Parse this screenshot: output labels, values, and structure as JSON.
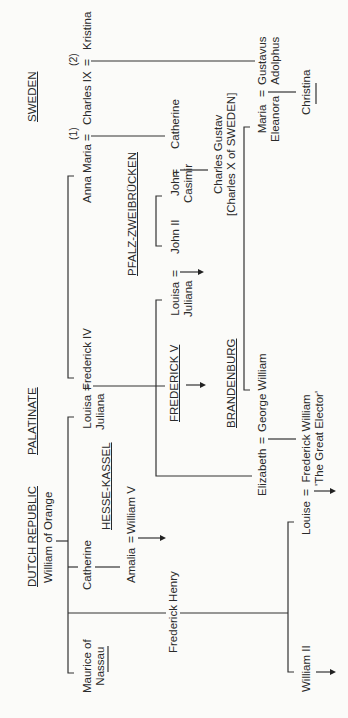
{
  "diagram": {
    "type": "family-tree",
    "orientation": "rotated-90-ccw",
    "houses": {
      "sweden": "SWEDEN",
      "palatinate": "PALATINATE",
      "pfalz": "PFALZ-ZWEIBRÜCKEN",
      "dutch": "DUTCH REPUBLIC",
      "hesse": "HESSE-KASSEL",
      "frederick_v": "FREDERICK V",
      "brandenburg": "BRANDENBURG"
    },
    "people": {
      "anna_maria": "Anna Maria",
      "charles_ix": "Charles IX",
      "kristina": "Kristina",
      "marriage_1": "(1)",
      "marriage_2": "(2)",
      "catherine_sweden": "Catherine",
      "john_ii": "John II",
      "john_casimir": "John\nCasimir",
      "charles_gustav": "Charles Gustav\n[Charles X of SWEDEN]",
      "gustavus_adolphus": "Gustavus\nAdolphus",
      "maria_eleanora": "Maria\nEleanora",
      "christina": "Christina",
      "frederick_iv": "Frederick IV",
      "louisa_juliana_1": "Louisa\nJuliana",
      "louisa_juliana_2": "Louisa\nJuliana",
      "george_william": "George William",
      "elizabeth": "Elizabeth",
      "frederick_william": "Frederick William\n'The Great Elector'",
      "william_of_orange": "William of Orange",
      "catherine_orange": "Catherine",
      "amalia": "Amalia",
      "william_v": "William V",
      "frederick_henry": "Frederick Henry",
      "maurice": "Maurice of\nNassau",
      "louise": "Louise",
      "william_ii": "William II"
    },
    "symbols": {
      "married": "=",
      "descendants_arrow": "→",
      "no_issue": "—"
    }
  }
}
